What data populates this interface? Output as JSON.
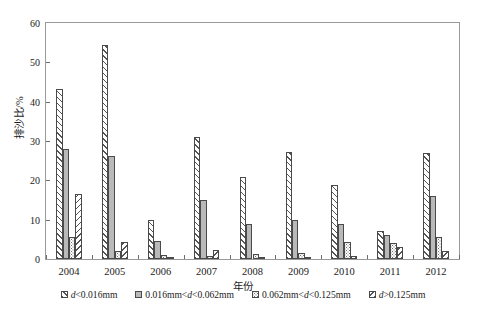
{
  "chart_data": {
    "type": "bar",
    "title": "",
    "xlabel": "年份",
    "ylabel": "排沙比/%",
    "categories": [
      "2004",
      "2005",
      "2006",
      "2007",
      "2008",
      "2009",
      "2010",
      "2011",
      "2012"
    ],
    "ylim": [
      0,
      60
    ],
    "yticks": [
      0,
      10,
      20,
      30,
      40,
      50,
      60
    ],
    "grid": false,
    "legend_position": "bottom",
    "series": [
      {
        "name": "d<0.016mm",
        "pattern": "forward-diagonal-hatch",
        "values": [
          43.2,
          54.5,
          10.0,
          31.0,
          20.8,
          27.3,
          18.7,
          7.0,
          27.0
        ]
      },
      {
        "name": "0.016mm<d<0.062mm",
        "pattern": "solid-grey",
        "values": [
          28.0,
          26.2,
          4.5,
          15.0,
          9.0,
          10.0,
          9.0,
          6.0,
          16.0
        ]
      },
      {
        "name": "0.062mm<d<0.125mm",
        "pattern": "dotted",
        "values": [
          5.5,
          2.0,
          1.0,
          0.8,
          1.2,
          1.5,
          4.2,
          4.0,
          5.5
        ]
      },
      {
        "name": "d>0.125mm",
        "pattern": "back-diagonal-hatch",
        "values": [
          16.5,
          4.2,
          0.4,
          2.2,
          0.5,
          0.5,
          0.8,
          3.0,
          2.0
        ]
      }
    ]
  },
  "legend": {
    "items": [
      {
        "label_pre": "",
        "label_italic": "d",
        "label_post": "<0.016mm"
      },
      {
        "label_pre": "0.016mm<",
        "label_italic": "d",
        "label_post": "<0.062mm"
      },
      {
        "label_pre": "0.062mm<",
        "label_italic": "d",
        "label_post": "<0.125mm"
      },
      {
        "label_pre": "",
        "label_italic": "d",
        "label_post": ">0.125mm"
      }
    ]
  },
  "colors": {
    "axis": "#6e6e6e",
    "frame": "#9a9a9a",
    "bar_outline": "#4a4a4a",
    "series2_fill": "#b9b9b9",
    "hatch": "#555555",
    "text": "#1a1a1a"
  }
}
